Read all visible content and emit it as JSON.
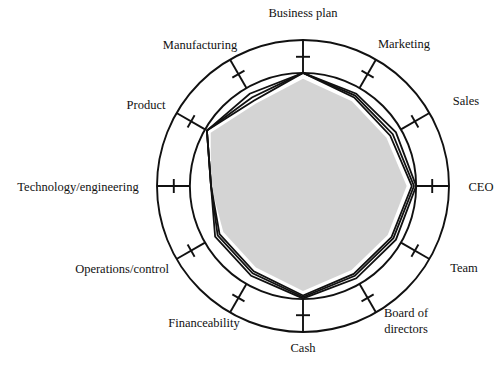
{
  "chart_data": {
    "type": "radar",
    "title": "",
    "subtitle": "",
    "xlabel": "",
    "ylabel": "",
    "grid": true,
    "legend_position": "none",
    "axis_range": [
      0,
      10
    ],
    "rings": [
      {
        "name": "outer-ring",
        "value": 10
      },
      {
        "name": "inner-ring",
        "value": 7.75
      }
    ],
    "tick_value": 8.85,
    "categories": [
      "Business plan",
      "Marketing",
      "Sales",
      "CEO",
      "Team",
      "Board of directors",
      "Cash",
      "Financeability",
      "Operations/control",
      "Technology/engineering",
      "Product",
      "Manufacturing"
    ],
    "category_angles_deg": [
      90,
      60,
      30,
      0,
      -30,
      -60,
      -90,
      -120,
      -150,
      180,
      150,
      120
    ],
    "series": [
      {
        "name": "Series A",
        "values": [
          7.75,
          7.3,
          7.35,
          7.75,
          7.35,
          7.3,
          7.7,
          7.1,
          6.95,
          6.3,
          7.6,
          7.3
        ]
      },
      {
        "name": "Series B",
        "values": [
          7.75,
          7.15,
          7.1,
          7.6,
          7.15,
          7.1,
          7.6,
          6.9,
          6.75,
          6.3,
          7.6,
          7.0
        ]
      },
      {
        "name": "Series C",
        "values": [
          7.75,
          7.0,
          6.9,
          7.45,
          7.0,
          6.95,
          7.5,
          6.75,
          6.6,
          6.3,
          7.6,
          6.75
        ]
      }
    ],
    "shaded_region": {
      "name": "shaded-core",
      "fill_color": "#d4d4d4",
      "values": [
        7.35,
        6.7,
        6.6,
        7.1,
        6.7,
        6.65,
        7.2,
        6.45,
        6.3,
        6.3,
        7.3,
        6.5
      ]
    }
  },
  "colors": {
    "stroke": "#111111",
    "fill": "#d4d4d4",
    "background": "#ffffff"
  },
  "labels": {
    "business_plan": "Business plan",
    "marketing": "Marketing",
    "sales": "Sales",
    "ceo": "CEO",
    "team": "Team",
    "board_of_directors_line1": "Board of",
    "board_of_directors_line2": "directors",
    "cash": "Cash",
    "financeability": "Financeability",
    "operations_control": "Operations/control",
    "technology_engineering": "Technology/engineering",
    "product": "Product",
    "manufacturing": "Manufacturing"
  }
}
